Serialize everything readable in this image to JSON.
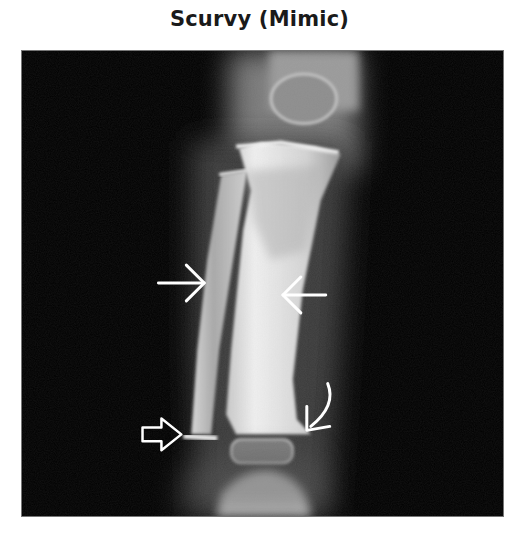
{
  "figure": {
    "title": "Scurvy (Mimic)",
    "image_alt": "Radiograph of a child's lower leg (tibia and fibula) with arrows marking findings",
    "annotations": [
      {
        "id": "arrow-right-pointing",
        "type": "open-arrow",
        "direction": "right",
        "target": "fibula shaft"
      },
      {
        "id": "arrow-left-pointing",
        "type": "open-arrow",
        "direction": "left",
        "target": "tibia shaft"
      },
      {
        "id": "hollow-arrow",
        "type": "hollow-arrow",
        "direction": "right",
        "target": "distal fibular metaphysis"
      },
      {
        "id": "curved-arrow",
        "type": "curved-arrow",
        "direction": "down-left",
        "target": "distal tibial metaphysis"
      }
    ],
    "colors": {
      "background": "#ffffff",
      "title": "#1a1a1a",
      "film": "#000000",
      "bone": "#d8d8d8",
      "arrow": "#ffffff"
    }
  }
}
